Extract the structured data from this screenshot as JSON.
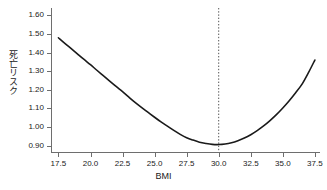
{
  "chart_data": {
    "type": "line",
    "title": "",
    "subtitle": "",
    "xlabel": "BMI",
    "ylabel": "死亡リスク",
    "xlim": [
      17.0,
      37.9
    ],
    "ylim": [
      0.865,
      1.64
    ],
    "xticks": [
      17.5,
      20.0,
      22.5,
      25.0,
      27.5,
      30.0,
      32.5,
      35.0,
      37.5
    ],
    "xticklabels": [
      "17.5",
      "20.0",
      "22.5",
      "25.0",
      "27.5",
      "30.0",
      "32.5",
      "35.0",
      "37.5"
    ],
    "yticks": [
      0.9,
      1.0,
      1.1,
      1.2,
      1.3,
      1.4,
      1.5,
      1.6
    ],
    "yticklabels": [
      "0.90",
      "1.00",
      "1.10",
      "1.20",
      "1.30",
      "1.40",
      "1.50",
      "1.60"
    ],
    "grid": false,
    "legend": null,
    "series": [
      {
        "name": "死亡リスク",
        "color": "#1a1a1a",
        "linewidth": 1.6,
        "x": [
          17.5,
          18.0,
          18.5,
          19.0,
          19.5,
          20.0,
          20.5,
          21.0,
          21.5,
          22.0,
          22.5,
          23.0,
          23.5,
          24.0,
          24.5,
          25.0,
          25.5,
          26.0,
          26.5,
          27.0,
          27.5,
          28.0,
          28.5,
          29.0,
          29.5,
          30.0,
          30.5,
          31.0,
          31.5,
          32.0,
          32.5,
          33.0,
          33.5,
          34.0,
          34.5,
          35.0,
          35.5,
          36.0,
          36.5,
          37.0,
          37.5
        ],
        "y": [
          1.48,
          1.45,
          1.421,
          1.392,
          1.363,
          1.335,
          1.305,
          1.276,
          1.247,
          1.218,
          1.19,
          1.16,
          1.131,
          1.104,
          1.078,
          1.052,
          1.027,
          1.004,
          0.981,
          0.96,
          0.942,
          0.929,
          0.918,
          0.911,
          0.906,
          0.905,
          0.908,
          0.915,
          0.926,
          0.94,
          0.958,
          0.98,
          1.005,
          1.034,
          1.066,
          1.102,
          1.141,
          1.184,
          1.23,
          1.292,
          1.36
        ]
      }
    ],
    "annotations": [
      {
        "kind": "vertical-reference-line",
        "name": "obesity-threshold",
        "x": 30.0,
        "style": "dotted",
        "color": "#555555",
        "linewidth": 1
      }
    ]
  },
  "axes": {
    "spines": [
      "left",
      "bottom"
    ],
    "spine_color": "#6e6e6e",
    "background": "#ffffff"
  }
}
